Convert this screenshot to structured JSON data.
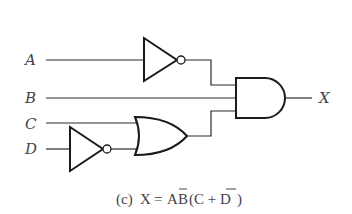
{
  "diagram": {
    "type": "logic-circuit",
    "inputs": [
      {
        "id": "A",
        "label": "A"
      },
      {
        "id": "B",
        "label": "B"
      },
      {
        "id": "C",
        "label": "C"
      },
      {
        "id": "D",
        "label": "D"
      }
    ],
    "output": {
      "id": "X",
      "label": "X"
    },
    "gates": [
      {
        "id": "inv1",
        "type": "NOT",
        "inputs": [
          "A"
        ]
      },
      {
        "id": "inv2",
        "type": "NOT",
        "inputs": [
          "D"
        ]
      },
      {
        "id": "or1",
        "type": "OR",
        "inputs": [
          "C",
          "inv2"
        ]
      },
      {
        "id": "and1",
        "type": "AND",
        "inputs": [
          "inv1",
          "B",
          "or1"
        ],
        "output": "X"
      }
    ],
    "caption": {
      "prefix": "(c)",
      "lhs": "X",
      "equals": "=",
      "expr_a": "A",
      "expr_b": "B",
      "expr_rest_open": "(C + D",
      "expr_rest_close": ")",
      "full": "(c) X = A̅B(C + D̅)"
    }
  }
}
